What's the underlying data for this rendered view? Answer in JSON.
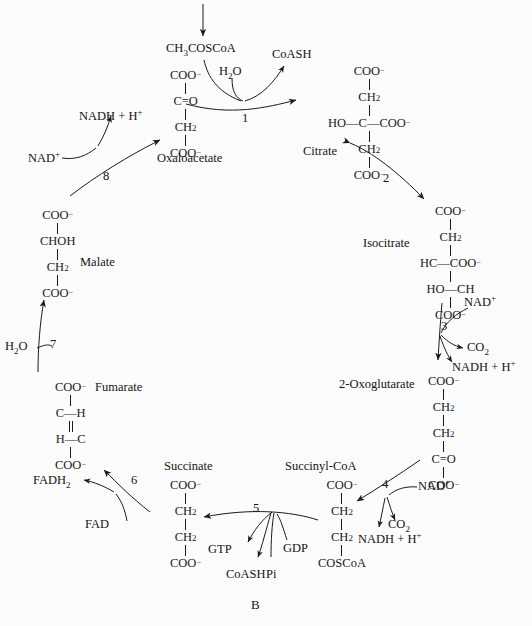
{
  "figure": {
    "label": "B",
    "background_color": "#fcfcfc",
    "ink_color": "#1a1a1a"
  },
  "inputs": {
    "acetyl_coa": "CH3COSCoA",
    "water_step1": "H2O",
    "water_step7": "H2O"
  },
  "metabolites": [
    {
      "id": "oxaloacetate",
      "name": "Oxaloacetate",
      "lines": [
        "COO-",
        "C=O",
        "CH2",
        "COO-"
      ]
    },
    {
      "id": "citrate",
      "name": "Citrate",
      "lines": [
        "COO-",
        "CH2",
        "HO-C-COO-",
        "CH2",
        "COO-"
      ]
    },
    {
      "id": "isocitrate",
      "name": "Isocitrate",
      "lines": [
        "COO-",
        "CH2",
        "HC-COO-",
        "HO-CH",
        "COO-"
      ]
    },
    {
      "id": "oxoglutarate",
      "name": "2-Oxoglutarate",
      "lines": [
        "COO-",
        "CH2",
        "CH2",
        "C=O",
        "COO-"
      ]
    },
    {
      "id": "succinyl_coa",
      "name": "Succinyl-CoA",
      "lines": [
        "COO-",
        "CH2",
        "CH2",
        "COSCoA"
      ]
    },
    {
      "id": "succinate",
      "name": "Succinate",
      "lines": [
        "COO-",
        "CH2",
        "CH2",
        "COO-"
      ]
    },
    {
      "id": "fumarate",
      "name": "Fumarate",
      "lines": [
        "COO-",
        "C-H",
        "H-C",
        "COO-"
      ]
    },
    {
      "id": "malate",
      "name": "Malate",
      "lines": [
        "COO-",
        "CHOH",
        "CH2",
        "COO-"
      ]
    }
  ],
  "steps": [
    {
      "number": "1",
      "between": "Acetyl-CoA + Oxaloacetate -> Citrate"
    },
    {
      "number": "2",
      "between": "Citrate <-> Isocitrate"
    },
    {
      "number": "3",
      "between": "Isocitrate -> 2-Oxoglutarate"
    },
    {
      "number": "4",
      "between": "2-Oxoglutarate -> Succinyl-CoA"
    },
    {
      "number": "5",
      "between": "Succinyl-CoA -> Succinate"
    },
    {
      "number": "6",
      "between": "Succinate -> Fumarate"
    },
    {
      "number": "7",
      "between": "Fumarate -> Malate"
    },
    {
      "number": "8",
      "between": "Malate -> Oxaloacetate"
    }
  ],
  "cofactors": {
    "coash_step1": "CoASH",
    "nad_step3": "NAD+",
    "co2_step3": "CO2",
    "nadh_step3": "NADH + H+",
    "nad_step4": "NAD+",
    "co2_step4": "CO2",
    "nadh_step4": "NADH + H+",
    "gdp_step5": "GDP",
    "pi_step5": "Pi",
    "gtp_step5": "GTP",
    "coash_step5": "CoASH",
    "fad_step6": "FAD",
    "fadh2_step6": "FADH2",
    "nad_step8": "NAD+",
    "nadh_step8": "NADH + H+"
  }
}
